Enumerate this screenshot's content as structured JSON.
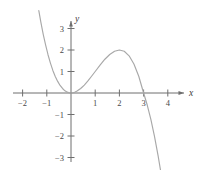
{
  "chart_data": {
    "type": "line",
    "title": "",
    "subtitle": "",
    "xlabel": "x",
    "ylabel": "y",
    "xlim": [
      -2.45,
      4.6
    ],
    "ylim": [
      -3.6,
      3.7
    ],
    "grid": false,
    "legend": null,
    "function": "y = 0.5*x^2*(3 - x)",
    "x_ticks": [
      -2,
      -1,
      1,
      2,
      3,
      4
    ],
    "x_tick_labels": [
      "−2",
      "−1",
      "1",
      "2",
      "3",
      "4"
    ],
    "y_ticks": [
      3,
      2,
      1,
      -1,
      -2,
      -3
    ],
    "y_tick_labels": [
      "3",
      "2",
      "1",
      "−1",
      "−2",
      "−3"
    ],
    "roots": [
      0,
      0,
      3
    ],
    "local_maximum": {
      "x": 2,
      "y": 1.3
    },
    "local_minimum": {
      "x": 0,
      "y": 0
    },
    "series": [
      {
        "name": "cubic",
        "color": "#a8a8a8",
        "x": [
          -1.33,
          -1.25,
          -1.15,
          -1.05,
          -0.95,
          -0.85,
          -0.75,
          -0.65,
          -0.55,
          -0.45,
          -0.35,
          -0.25,
          -0.15,
          -0.05,
          0,
          0.05,
          0.15,
          0.25,
          0.4,
          0.55,
          0.7,
          0.85,
          1.0,
          1.2,
          1.4,
          1.6,
          1.8,
          2.0,
          2.2,
          2.4,
          2.6,
          2.8,
          3.0,
          3.15,
          3.3,
          3.45,
          3.6,
          3.72
        ],
        "y": [
          3.83,
          3.32,
          2.74,
          2.24,
          1.78,
          1.39,
          1.05,
          0.77,
          0.54,
          0.35,
          0.21,
          0.1,
          0.04,
          0.0,
          0.0,
          0.0,
          0.03,
          0.09,
          0.21,
          0.37,
          0.56,
          0.78,
          1.0,
          1.3,
          1.57,
          1.79,
          1.94,
          2.0,
          1.94,
          1.73,
          1.35,
          0.78,
          0.0,
          -0.56,
          -1.23,
          -2.02,
          -2.92,
          -3.73
        ]
      }
    ]
  },
  "axes": {
    "x_axis_name": "x",
    "y_axis_name": "y"
  },
  "geometry": {
    "origin_x": 71,
    "origin_y": 93,
    "unit_px_x": 24.2,
    "unit_px_y": 21.5
  }
}
